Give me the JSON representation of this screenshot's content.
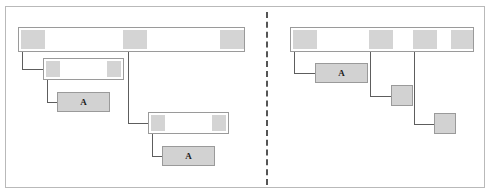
{
  "diagram": {
    "panels": [
      {
        "id": "left-panel",
        "name": "left-panel",
        "nodes": [
          {
            "id": "L-root",
            "name": "left-root-bar",
            "label": "",
            "filled": false,
            "x": 18,
            "y": 27,
            "w": 227,
            "h": 25,
            "segments": [
              {
                "x": 2,
                "w": 24
              },
              {
                "x": 104,
                "w": 24
              },
              {
                "x": 201,
                "w": 24
              }
            ]
          },
          {
            "id": "L-child1",
            "name": "left-child-bar-1",
            "label": "",
            "filled": false,
            "x": 43,
            "y": 58,
            "w": 81,
            "h": 22,
            "segments": [
              {
                "x": 2,
                "w": 14
              },
              {
                "x": 63,
                "w": 14
              }
            ]
          },
          {
            "id": "L-leafA1",
            "name": "left-leaf-a-1",
            "label": "A",
            "filled": true,
            "x": 57,
            "y": 92,
            "w": 53,
            "h": 20,
            "segments": []
          },
          {
            "id": "L-child2",
            "name": "left-child-bar-2",
            "label": "",
            "filled": false,
            "x": 148,
            "y": 112,
            "w": 81,
            "h": 22,
            "segments": [
              {
                "x": 2,
                "w": 14
              },
              {
                "x": 63,
                "w": 14
              }
            ]
          },
          {
            "id": "L-leafA2",
            "name": "left-leaf-a-2",
            "label": "A",
            "filled": true,
            "x": 162,
            "y": 146,
            "w": 53,
            "h": 20,
            "segments": []
          }
        ],
        "connectors": [
          {
            "name": "conn-left-root-to-child1",
            "x1": 22,
            "y1": 52,
            "x2": 43,
            "y2": 69
          },
          {
            "name": "conn-left-child1-to-leafa1",
            "x1": 47,
            "y1": 80,
            "x2": 57,
            "y2": 102
          },
          {
            "name": "conn-left-root-to-child2",
            "x1": 128,
            "y1": 52,
            "x2": 148,
            "y2": 123
          },
          {
            "name": "conn-left-child2-to-leafa2",
            "x1": 152,
            "y1": 134,
            "x2": 162,
            "y2": 156
          }
        ]
      },
      {
        "id": "right-panel",
        "name": "right-panel",
        "nodes": [
          {
            "id": "R-root",
            "name": "right-root-bar",
            "label": "",
            "filled": false,
            "x": 290,
            "y": 27,
            "w": 184,
            "h": 25,
            "segments": [
              {
                "x": 2,
                "w": 24
              },
              {
                "x": 78,
                "w": 24
              },
              {
                "x": 122,
                "w": 24
              },
              {
                "x": 160,
                "w": 22
              }
            ]
          },
          {
            "id": "R-leafA1",
            "name": "right-leaf-a-1",
            "label": "A",
            "filled": true,
            "x": 315,
            "y": 63,
            "w": 53,
            "h": 20,
            "segments": []
          },
          {
            "id": "R-leafSq1",
            "name": "right-leaf-square-1",
            "label": "",
            "filled": true,
            "x": 391,
            "y": 85,
            "w": 22,
            "h": 21,
            "segments": []
          },
          {
            "id": "R-leafSq2",
            "name": "right-leaf-square-2",
            "label": "",
            "filled": true,
            "x": 434,
            "y": 113,
            "w": 22,
            "h": 21,
            "segments": []
          }
        ],
        "connectors": [
          {
            "name": "conn-right-root-to-leafa1",
            "x1": 294,
            "y1": 52,
            "x2": 315,
            "y2": 73
          },
          {
            "name": "conn-right-root-to-square1",
            "x1": 370,
            "y1": 52,
            "x2": 391,
            "y2": 96
          },
          {
            "name": "conn-right-root-to-square2",
            "x1": 414,
            "y1": 52,
            "x2": 434,
            "y2": 124
          }
        ]
      }
    ]
  },
  "colors": {
    "frame_border": "#b9b9b9",
    "node_border": "#9a9a9a",
    "node_fill": "#d2d2d2",
    "segment_fill": "#d4d4d4",
    "connector": "#5d5d5d",
    "divider": "#555555",
    "background": "#ffffff",
    "label_text": "#1a1a1a"
  }
}
